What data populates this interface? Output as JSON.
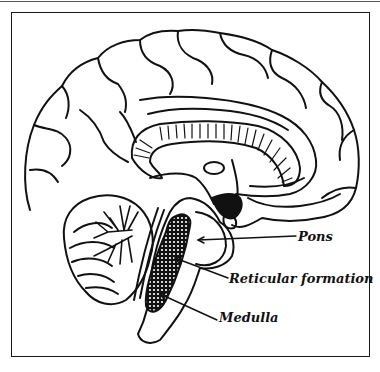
{
  "diagram": {
    "labels": [
      {
        "id": "pons",
        "text": "Pons"
      },
      {
        "id": "reticular_formation",
        "text": "Reticular formation"
      },
      {
        "id": "medulla",
        "text": "Medulla"
      }
    ],
    "colors": {
      "line": "#111111",
      "background": "#ffffff"
    }
  }
}
